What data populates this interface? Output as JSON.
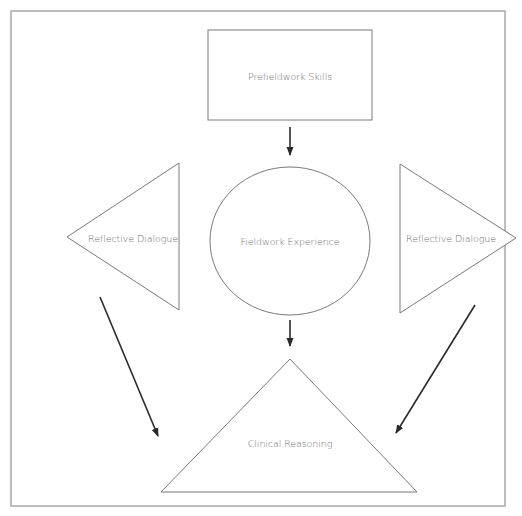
{
  "diagram": {
    "type": "flow",
    "nodes": [
      {
        "id": "prefieldwork",
        "shape": "rectangle",
        "label": "Prefieldwork Skills"
      },
      {
        "id": "fieldwork",
        "shape": "circle",
        "label": "Fieldwork Experience"
      },
      {
        "id": "reflective_left",
        "shape": "triangle-left",
        "label": "Reflective Dialogue"
      },
      {
        "id": "reflective_right",
        "shape": "triangle-right",
        "label": "Reflective Dialogue"
      },
      {
        "id": "clinical",
        "shape": "triangle-up",
        "label": "Clinical Reasoning"
      }
    ],
    "edges": [
      {
        "from": "prefieldwork",
        "to": "fieldwork"
      },
      {
        "from": "fieldwork",
        "to": "clinical"
      },
      {
        "from": "reflective_left",
        "to": "clinical"
      },
      {
        "from": "reflective_right",
        "to": "clinical"
      }
    ],
    "colors": {
      "shape_stroke": "#7a7a7a",
      "arrow": "#2a2a2a",
      "frame": "#a8a8a8",
      "text": "#6e6e6e",
      "background": "#ffffff"
    }
  }
}
